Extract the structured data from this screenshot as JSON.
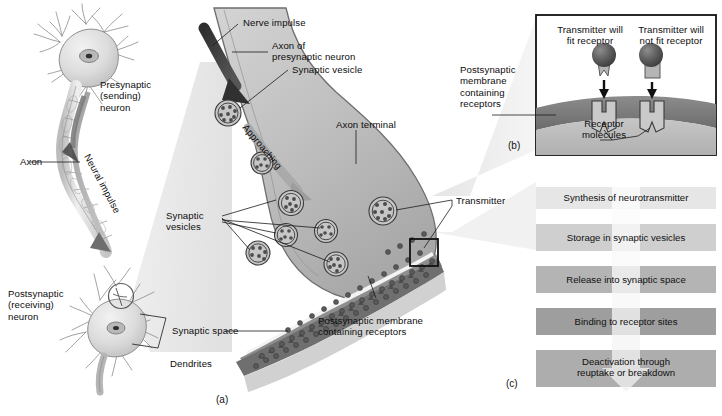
{
  "figure": {
    "panels": [
      {
        "id": "a",
        "letter": "(a)",
        "caption": "Synapse and axon terminal detail"
      },
      {
        "id": "b",
        "letter": "(b)",
        "caption": "Receptor fit detail"
      },
      {
        "id": "c",
        "letter": "(c)",
        "caption": "Neurotransmitter life cycle"
      }
    ]
  },
  "panel_a": {
    "labels": {
      "presynaptic_neuron": "Presynaptic\n(sending)\nneuron",
      "axon": "Axon",
      "neural_impulse": "Neural impulse",
      "postsynaptic_neuron": "Postsynaptic\n(receiving)\nneuron",
      "dendrites": "Dendrites",
      "nerve_impulse": "Nerve impulse",
      "axon_of_presynaptic_neuron": "Axon of\npresynaptic neuron",
      "synaptic_vesicle": "Synaptic vesicle",
      "approaching": "Approaching",
      "axon_terminal": "Axon terminal",
      "synaptic_vesicles": "Synaptic\nvesicles",
      "synaptic_space": "Synaptic space",
      "postsynaptic_membrane": "Postsynaptic membrane\ncontaining receptors",
      "transmitter": "Transmitter"
    }
  },
  "panel_b": {
    "labels": {
      "fit": "Transmitter will\nfit receptor",
      "not_fit": "Transmitter will\nnot fit receptor",
      "membrane": "Postsynaptic\nmembrane\ncontaining\nreceptors",
      "receptor_molecules": "Receptor\nmolecules"
    }
  },
  "panel_c": {
    "steps": [
      {
        "label": "Synthesis of neurotransmitter",
        "fill": "#e6e6e6"
      },
      {
        "label": "Storage in synaptic vesicles",
        "fill": "#cfcfcf"
      },
      {
        "label": "Release into synaptic space",
        "fill": "#b4b4b4"
      },
      {
        "label": "Binding to receptor sites",
        "fill": "#9e9e9e"
      },
      {
        "label": "Deactivation through\nreuptake or breakdown",
        "fill": "#adadad"
      }
    ]
  },
  "colors": {
    "background": "#ffffff",
    "ink": "#111111",
    "cell_body": "#d8d8d8",
    "terminal_fill": "#b9b9b9",
    "membrane_dark": "#6f6f6f",
    "membrane_mid": "#9a9a9a",
    "vesicle_fill": "#c8c8c8",
    "transmitter_dot": "#4a4a4a",
    "cone": "#e4e4e4",
    "arrow_dark": "#3a3a3a"
  }
}
